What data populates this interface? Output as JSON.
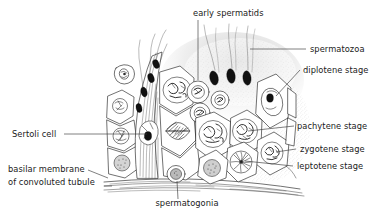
{
  "figure": {
    "background_color": "#ffffff",
    "ink_color": "#1a1a1a",
    "label_color": "#1b1b1b"
  },
  "labels": {
    "early_spermatids": "early spermatids",
    "spermatozoa": "spermatozoa",
    "diplotene_stage": "diplotene stage",
    "pachytene_stage": "pachytene stage",
    "zygotene_stage": "zygotene stage",
    "leptotene_stage": "leptotene stage",
    "sertoli_cell": "Sertoli cell",
    "basilar_membrane_line1": "basilar membrane",
    "basilar_membrane_line2": "of convoluted tubule",
    "spermatogonia": "spermatogonia"
  },
  "callouts": [
    {
      "name": "early-spermatids",
      "text": "early spermatids",
      "side": "top",
      "x": 193,
      "y": 16
    },
    {
      "name": "spermatozoa",
      "text": "spermatozoa",
      "side": "right",
      "x": 310,
      "y": 52
    },
    {
      "name": "diplotene-stage",
      "text": "diplotene stage",
      "side": "right",
      "x": 303,
      "y": 73
    },
    {
      "name": "pachytene-stage",
      "text": "pachytene stage",
      "side": "right",
      "x": 297,
      "y": 129
    },
    {
      "name": "zygotene-stage",
      "text": "zygotene stage",
      "side": "right",
      "x": 300,
      "y": 152
    },
    {
      "name": "leptotene-stage",
      "text": "leptotene stage",
      "side": "right",
      "x": 297,
      "y": 169
    },
    {
      "name": "sertoli-cell",
      "text": "Sertoli cell",
      "side": "left",
      "x": 12,
      "y": 137
    },
    {
      "name": "basilar-membrane",
      "text": "basilar membrane",
      "side": "left",
      "x": 8,
      "y": 172
    },
    {
      "name": "spermatogonia",
      "text": "spermatogonia",
      "side": "bottom",
      "x": 187,
      "y": 206
    }
  ],
  "cell_stages": [
    {
      "name": "spermatogonia",
      "description": "basal small cell with stippled nucleus resting on basilar membrane"
    },
    {
      "name": "leptotene",
      "description": "nucleus with fine thread-like chromatin"
    },
    {
      "name": "zygotene",
      "description": "nucleus with paired looping chromatin threads"
    },
    {
      "name": "pachytene",
      "description": "nucleus with thick coiled chromosomes"
    },
    {
      "name": "diplotene",
      "description": "large oval nucleus with condensed dark nucleolus"
    },
    {
      "name": "early spermatids",
      "description": "small round cells with compact nuclei near lumen"
    },
    {
      "name": "spermatozoa",
      "description": "dark elongate heads with long flagellar tails projecting into lumen"
    },
    {
      "name": "sertoli cell",
      "description": "tall columnar supporting cell spanning epithelium with dark nucleus"
    },
    {
      "name": "meiotic spindle",
      "description": "dividing cell showing spindle with aligned chromosomes"
    }
  ]
}
